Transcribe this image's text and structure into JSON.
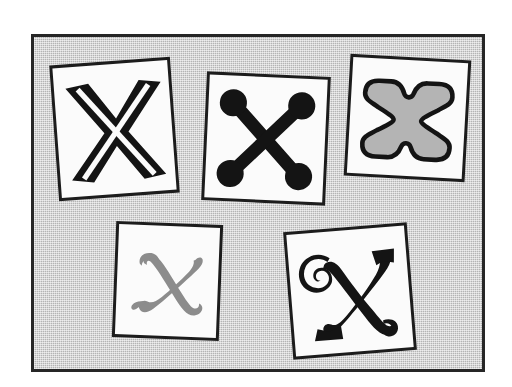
{
  "poster": {
    "title": "Five framed letter X specimens",
    "background_color": "#b4b4b4",
    "frame_border_color": "#262626",
    "canvas_color": "#ffffff",
    "card_paper_color": "#fbfbfb",
    "card_border_color": "#1c1c1c",
    "count": 5
  },
  "cards": [
    {
      "id": "card-1",
      "label": "Uppercase X, bold slab with white inline",
      "glyph": "X",
      "style_name": "bold-inline-slab",
      "ink_color": "#141414",
      "rotation_deg": -4.2
    },
    {
      "id": "card-2",
      "label": "Uppercase X, bar strokes with round ball terminals",
      "glyph": "X",
      "style_name": "ball-terminal-bars",
      "ink_color": "#141414",
      "rotation_deg": 2.6
    },
    {
      "id": "card-3",
      "label": "Uppercase X, hollow outline with bulbous serifs",
      "glyph": "X",
      "style_name": "outline-bulbous-serif",
      "ink_color": "#141414",
      "fill_color": "#b4b4b4",
      "rotation_deg": 3.2
    },
    {
      "id": "card-4",
      "label": "Lowercase x, gray italic script",
      "glyph": "x",
      "style_name": "gray-italic-script",
      "ink_color": "#8c8c8c",
      "rotation_deg": 2.2
    },
    {
      "id": "card-5",
      "label": "Uppercase X, ornate blackletter with spiral flourish",
      "glyph": "X",
      "style_name": "ornate-flourish-blackletter",
      "ink_color": "#141414",
      "rotation_deg": -4.6
    }
  ]
}
